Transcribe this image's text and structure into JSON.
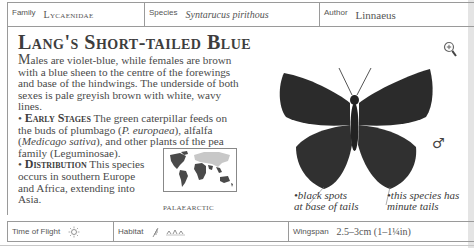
{
  "header": {
    "family_label": "Family",
    "family_value": "Lycaenidae",
    "species_label": "Species",
    "species_value": "Syntarucus pirithous",
    "author_label": "Author",
    "author_value": "Linnaeus"
  },
  "entry": {
    "title": "Lang's Short-tailed Blue",
    "intro_initial": "M",
    "intro": "ales are violet-blue, while females are brown with a blue sheen to the centre of the forewings and base of the hindwings. The underside of both sexes is pale greyish brown with white, wavy lines.",
    "early_stages": {
      "heading": "Early Stages",
      "text_1": " The green caterpillar feeds on the buds of plumbago (",
      "italic_1": "P. europaea",
      "text_2": "), alfalfa (",
      "italic_2": "Medicago sativa",
      "text_3": "), and other plants of the pea family (Leguminosae)."
    },
    "distribution": {
      "heading": "Distribution",
      "text": " This species occurs in southern Europe and  Africa, extending into Asia."
    },
    "bullet": "•"
  },
  "map": {
    "label": "PALAEARCTIC",
    "colors": {
      "highlight": "#c8c8c8",
      "other": "#4a4a4a"
    }
  },
  "illustration": {
    "sex_symbol": "♂",
    "annotations": [
      {
        "text_line1": "black spots",
        "text_line2": "at base of tails"
      },
      {
        "text_line1": "this species has",
        "text_line2": "minute tails"
      }
    ]
  },
  "footer": {
    "time_label": "Time of Flight",
    "time_icon": "sun-icon",
    "habitat_label": "Habitat",
    "habitat_icons": [
      "grass-icon",
      "meadow-icon"
    ],
    "wingspan_label": "Wingspan",
    "wingspan_value": "2.5–3cm (1–1¼in)"
  }
}
